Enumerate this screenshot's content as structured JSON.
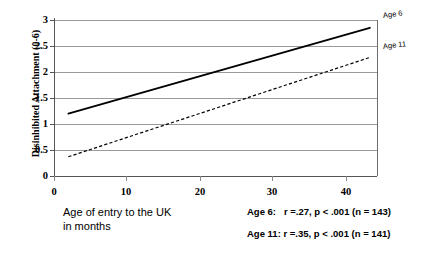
{
  "chart_data": {
    "type": "line",
    "title": "",
    "xlabel": "Age of entry to the UK\nin months",
    "ylabel": "Disinhibited Attachment (0-6)",
    "xlim": [
      0,
      45
    ],
    "ylim": [
      0,
      3
    ],
    "xticks": [
      "0",
      "10",
      "20",
      "30",
      "40"
    ],
    "xtick_values": [
      0,
      10,
      20,
      30,
      40
    ],
    "yticks": [
      "0",
      "0.5",
      "1",
      "1.5",
      "2",
      "2.5",
      "3"
    ],
    "ytick_values": [
      0,
      0.5,
      1,
      1.5,
      2,
      2.5,
      3
    ],
    "grid": "horizontal",
    "legend": "inline-right",
    "series": [
      {
        "name": "Age 6",
        "style": "solid",
        "color": "#000000",
        "x": [
          2,
          44
        ],
        "values": [
          1.2,
          2.85
        ]
      },
      {
        "name": "Age 11",
        "style": "dashed",
        "color": "#000000",
        "x": [
          2,
          44
        ],
        "values": [
          0.37,
          2.28
        ]
      }
    ],
    "annotations": [
      "Age 6:   r =.27, p < .001 (n = 143)",
      "Age 11: r =.35, p < .001 (n = 141)"
    ]
  }
}
